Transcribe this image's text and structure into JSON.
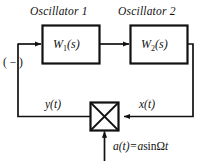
{
  "diagram": {
    "type": "block-diagram",
    "background_color": "#ffffff",
    "line_color": "#111111",
    "blocks": [
      {
        "id": "oscillator-1",
        "caption": "Oscillator 1",
        "transfer_function": "W",
        "subscript": "1",
        "argument": "(s)"
      },
      {
        "id": "oscillator-2",
        "caption": "Oscillator 2",
        "transfer_function": "W",
        "subscript": "2",
        "argument": "(s)"
      }
    ],
    "multiplier": {
      "id": "multiplier-block",
      "symbol": "X"
    },
    "signals": {
      "feedback_sign": "( − )",
      "output_feedback": "y(t)",
      "loop_input": "x(t)",
      "modulation_lhs": "a(t)=",
      "modulation_amplitude": "a",
      "modulation_fn": "sin",
      "modulation_freq": "Ω",
      "modulation_time": "t",
      "modulation_full": "a(t)= asinΩt"
    }
  }
}
